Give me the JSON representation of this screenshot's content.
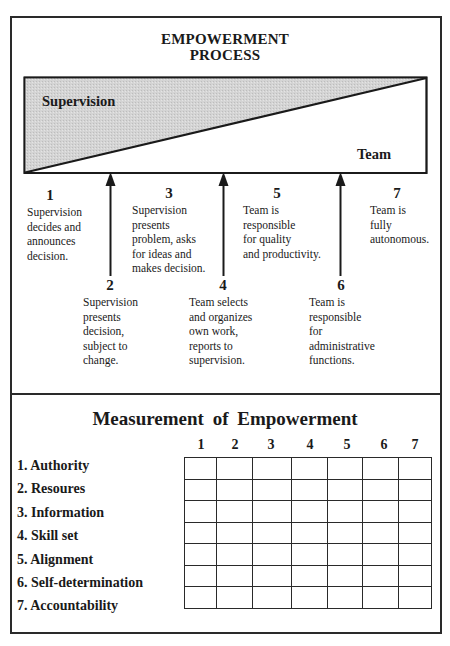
{
  "process": {
    "title_line1": "EMPOWERMENT",
    "title_line2": "PROCESS",
    "supervision_label": "Supervision",
    "team_label": "Team",
    "colors": {
      "supervision_fill": "#cfcfcf",
      "line": "#1a1a1a",
      "background": "#ffffff"
    },
    "steps": [
      {
        "number": "1",
        "description": "Supervision\ndecides and\nannounces\ndecision."
      },
      {
        "number": "2",
        "description": "Supervision\npresents\ndecision,\nsubject to\nchange."
      },
      {
        "number": "3",
        "description": "Supervision\npresents\nproblem, asks\nfor ideas and\nmakes decision."
      },
      {
        "number": "4",
        "description": "Team selects\nand organizes\nown work,\nreports to\nsupervision."
      },
      {
        "number": "5",
        "description": "Team is\nresponsible\nfor quality\nand productivity."
      },
      {
        "number": "6",
        "description": "Team is\nresponsible\nfor\nadministrative\nfunctions."
      },
      {
        "number": "7",
        "description": "Team is\nfully\nautonomous."
      }
    ]
  },
  "measurement": {
    "title": "Measurement of Empowerment",
    "columns": [
      "1",
      "2",
      "3",
      "4",
      "5",
      "6",
      "7"
    ],
    "rows": [
      "1. Authority",
      "2. Resoures",
      "3. Information",
      "4. Skill set",
      "5. Alignment",
      "6. Self-determination",
      "7. Accountability"
    ]
  }
}
